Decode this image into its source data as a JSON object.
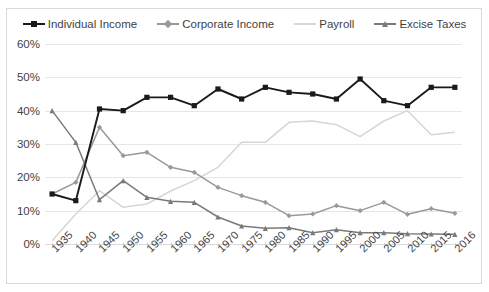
{
  "chart_data": {
    "type": "line",
    "title": "",
    "xlabel": "",
    "ylabel": "",
    "ylim": [
      0,
      60
    ],
    "ytick_labels": [
      "0%",
      "10%",
      "20%",
      "30%",
      "40%",
      "50%",
      "60%"
    ],
    "ytick_values": [
      0,
      10,
      20,
      30,
      40,
      50,
      60
    ],
    "grid": true,
    "legend_position": "top-center",
    "categories": [
      "1935",
      "1940",
      "1945",
      "1950",
      "1955",
      "1960",
      "1965",
      "1970",
      "1975",
      "1980",
      "1985",
      "1990",
      "1995",
      "2000",
      "2005",
      "2010",
      "2015",
      "2016"
    ],
    "series": [
      {
        "name": "Individual Income",
        "color": "#1a1a1a",
        "marker": "square",
        "values": [
          15,
          13,
          40.5,
          40,
          44,
          44,
          41.5,
          46.5,
          43.5,
          47,
          45.5,
          45,
          43.5,
          49.5,
          43,
          41.5,
          47,
          47
        ]
      },
      {
        "name": "Corporate Income",
        "color": "#999999",
        "marker": "diamond",
        "values": [
          15,
          18.5,
          35,
          26.5,
          27.5,
          23,
          21.5,
          17,
          14.5,
          12.5,
          8.5,
          9,
          11.5,
          10,
          12.5,
          8.9,
          10.6,
          9.2
        ]
      },
      {
        "name": "Payroll",
        "color": "#d6d6d6",
        "marker": "none",
        "values": [
          1,
          9,
          16,
          11,
          12,
          15.9,
          19,
          23,
          30.5,
          30.5,
          36.5,
          36.9,
          35.8,
          32.2,
          36.9,
          40,
          32.8,
          33.5
        ]
      },
      {
        "name": "Excise Taxes",
        "color": "#7a7a7a",
        "marker": "triangle",
        "values": [
          40,
          30.5,
          13.3,
          19,
          14,
          12.8,
          12.5,
          8.1,
          5.4,
          4.7,
          4.9,
          3.4,
          4.3,
          3.4,
          3.4,
          3.1,
          3,
          2.9
        ]
      }
    ]
  },
  "legend": {
    "items": [
      {
        "label": "Individual Income"
      },
      {
        "label": "Corporate Income"
      },
      {
        "label": "Payroll"
      },
      {
        "label": "Excise Taxes"
      }
    ]
  }
}
